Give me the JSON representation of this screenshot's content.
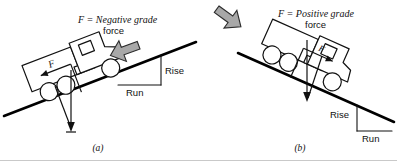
{
  "figure": {
    "title_text": "Grade force on a vehicle on an incline",
    "baseline_color": "#c9c9c9",
    "ink_color": "#111111",
    "gray_arrow_fill": "#a8a8a8",
    "gray_arrow_stroke": "#2b2b2b"
  },
  "panel_a": {
    "caption": "(a)",
    "force_label_line1": "F = Negative grade",
    "force_label_line2": "force",
    "force_symbol": "F",
    "rise_label": "Rise",
    "run_label": "Run",
    "slope_direction": "uphill-to-the-right",
    "gray_arrow_direction": "down-left",
    "weight_vector_direction": "down"
  },
  "panel_b": {
    "caption": "(b)",
    "force_label_line1": "F = Positive grade",
    "force_label_line2": "force",
    "force_symbol": "F",
    "rise_label": "Rise",
    "run_label": "Run",
    "slope_direction": "downhill-to-the-right",
    "gray_arrow_direction": "down-right",
    "weight_vector_direction": "down"
  }
}
